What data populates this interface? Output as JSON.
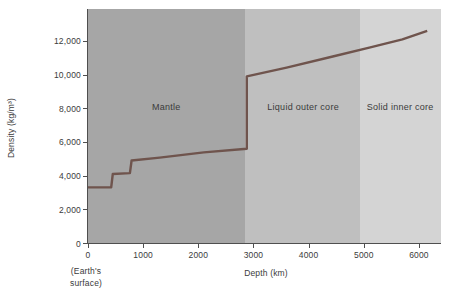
{
  "figure": {
    "ylabel": "Density (kg/m³)",
    "xlabel": "Depth (km)",
    "origin_note_line1": "(Earth's",
    "origin_note_line2": "surface)"
  },
  "chart_data": {
    "type": "line",
    "xlabel": "Depth (km)",
    "ylabel": "Density (kg/m³)",
    "xlim": [
      0,
      6400
    ],
    "ylim": [
      0,
      13900
    ],
    "x_ticks": [
      0,
      1000,
      2000,
      3000,
      4000,
      5000,
      6000
    ],
    "x_tick_labels": [
      "0",
      "1000",
      "2000",
      "3000",
      "4000",
      "5000",
      "6000"
    ],
    "y_ticks": [
      0,
      2000,
      4000,
      6000,
      8000,
      10000,
      12000
    ],
    "y_tick_labels": [
      "0",
      "2,000",
      "4,000",
      "6,000",
      "8,000",
      "10,000",
      "12,000"
    ],
    "x_origin_note": "(Earth's surface)",
    "grid": false,
    "legend": "none",
    "regions": [
      {
        "label": "Mantle",
        "x_start": 0,
        "x_end": 2850,
        "color": "#a6a6a6",
        "label_x": 1420,
        "label_y": 8050
      },
      {
        "label": "Liquid outer core",
        "x_start": 2850,
        "x_end": 4940,
        "color": "#bfbfbf",
        "label_x": 3900,
        "label_y": 8050
      },
      {
        "label": "Solid inner core",
        "x_start": 4940,
        "x_end": 6400,
        "color": "#d4d4d4",
        "label_x": 5660,
        "label_y": 8050
      }
    ],
    "series": [
      {
        "name": "Earth density profile",
        "color": "#6f544d",
        "points": [
          [
            0,
            3300
          ],
          [
            420,
            3300
          ],
          [
            450,
            4100
          ],
          [
            760,
            4150
          ],
          [
            790,
            4900
          ],
          [
            1300,
            5070
          ],
          [
            2100,
            5380
          ],
          [
            2880,
            5600
          ],
          [
            2880,
            9900
          ],
          [
            3600,
            10420
          ],
          [
            4400,
            11050
          ],
          [
            5100,
            11600
          ],
          [
            5700,
            12100
          ],
          [
            6150,
            12600
          ]
        ]
      }
    ]
  }
}
